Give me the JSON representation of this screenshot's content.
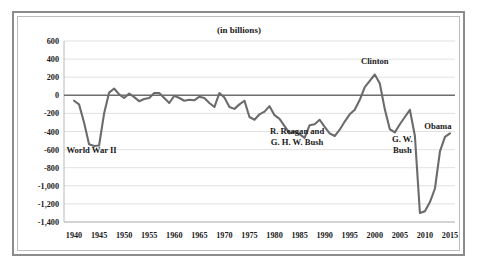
{
  "figure": {
    "title": "(in billions)",
    "frame_style": "double-border"
  },
  "colors": {
    "line": "#6b6b6b",
    "grid": "#d9d9d9",
    "zero_axis": "#6e6e6e",
    "frame_outer": "#8c8c8c",
    "frame_inner": "#bdbdbd",
    "text": "#1a1a1a",
    "background": "#ffffff"
  },
  "annotations": [
    {
      "name": "world-war-ii",
      "lines": [
        "World War II"
      ],
      "x_year": 1943.5,
      "y_value": -640
    },
    {
      "name": "reagan-bush",
      "lines": [
        "R. Reagan and",
        "G. H. W. Bush"
      ],
      "x_year": 1984.5,
      "y_value": -430
    },
    {
      "name": "clinton",
      "lines": [
        "Clinton"
      ],
      "x_year": 2000.0,
      "y_value": 350
    },
    {
      "name": "gw-bush",
      "lines": [
        "G. W.",
        "Bush"
      ],
      "x_year": 2005.5,
      "y_value": -520
    },
    {
      "name": "obama",
      "lines": [
        "Obama"
      ],
      "x_year": 2012.6,
      "y_value": -370
    }
  ],
  "chart_data": {
    "type": "line",
    "title": "(in billions)",
    "subtitle": "",
    "xlabel": "",
    "ylabel": "",
    "units": "billions of dollars",
    "grid": true,
    "legend": "none",
    "xlim": [
      1938,
      2016
    ],
    "ylim": [
      -1400,
      600
    ],
    "xticks": [
      1940,
      1945,
      1950,
      1955,
      1960,
      1965,
      1970,
      1975,
      1980,
      1985,
      1990,
      1995,
      2000,
      2005,
      2010,
      2015
    ],
    "yticks": [
      600,
      400,
      200,
      0,
      -200,
      -400,
      -600,
      -800,
      -1000,
      -1200,
      -1400
    ],
    "ytick_labels": [
      "600",
      "400",
      "200",
      "0",
      "-200",
      "-400",
      "-600",
      "-800",
      "-1,000",
      "-1,200",
      "-1,400"
    ],
    "xtick_labels": [
      "1940",
      "1945",
      "1950",
      "1955",
      "1960",
      "1965",
      "1970",
      "1975",
      "1980",
      "1985",
      "1990",
      "1995",
      "2000",
      "2005",
      "2010",
      "2015"
    ],
    "series": [
      {
        "name": "Federal surplus or deficit",
        "x": [
          1940,
          1941,
          1942,
          1943,
          1944,
          1945,
          1946,
          1947,
          1948,
          1949,
          1950,
          1951,
          1952,
          1953,
          1954,
          1955,
          1956,
          1957,
          1958,
          1959,
          1960,
          1961,
          1962,
          1963,
          1964,
          1965,
          1966,
          1967,
          1968,
          1969,
          1970,
          1971,
          1972,
          1973,
          1974,
          1975,
          1976,
          1977,
          1978,
          1979,
          1980,
          1981,
          1982,
          1983,
          1984,
          1985,
          1986,
          1987,
          1988,
          1989,
          1990,
          1991,
          1992,
          1993,
          1994,
          1995,
          1996,
          1997,
          1998,
          1999,
          2000,
          2001,
          2002,
          2003,
          2004,
          2005,
          2006,
          2007,
          2008,
          2009,
          2010,
          2011,
          2012,
          2013,
          2014,
          2015
        ],
        "values": [
          -60,
          -100,
          -300,
          -540,
          -560,
          -555,
          -200,
          30,
          75,
          10,
          -30,
          20,
          -20,
          -65,
          -40,
          -30,
          25,
          25,
          -30,
          -85,
          -5,
          -30,
          -60,
          -50,
          -55,
          -15,
          -30,
          -85,
          -130,
          25,
          -25,
          -130,
          -150,
          -100,
          -60,
          -240,
          -270,
          -210,
          -180,
          -120,
          -220,
          -260,
          -340,
          -420,
          -400,
          -430,
          -470,
          -330,
          -320,
          -270,
          -350,
          -420,
          -450,
          -380,
          -290,
          -210,
          -160,
          -50,
          90,
          160,
          230,
          130,
          -155,
          -375,
          -410,
          -320,
          -240,
          -160,
          -450,
          -1300,
          -1280,
          -1180,
          -1030,
          -620,
          -460,
          -420
        ]
      }
    ],
    "notable_points": [
      {
        "label": "World War II trough",
        "x": 1943,
        "y": -540
      },
      {
        "label": "Clinton surplus peak",
        "x": 2000,
        "y": 230
      },
      {
        "label": "Great Recession trough",
        "x": 2009,
        "y": -1300
      }
    ]
  }
}
